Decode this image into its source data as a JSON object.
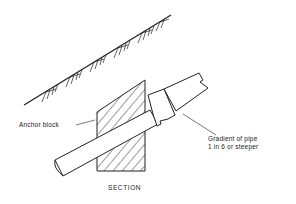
{
  "diagram": {
    "title": "SECTION",
    "labels": {
      "anchor_block": "Anchor block",
      "gradient_line1": "Gradient of pipe",
      "gradient_line2": "1 in 6 or steeper"
    },
    "elements": [
      "ground-slope",
      "anchor-block",
      "pipe",
      "pipe-collar",
      "leader-lines"
    ],
    "colors": {
      "line": "#222222",
      "background": "#ffffff"
    }
  }
}
